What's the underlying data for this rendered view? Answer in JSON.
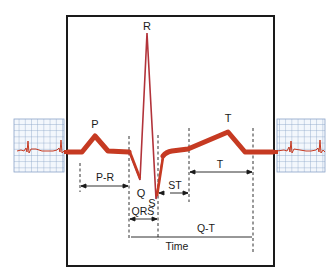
{
  "diagram": {
    "colors": {
      "trace": "#c63a22",
      "spike": "#b2333a",
      "grid": "#8aa3c8",
      "grid_bg": "#f3f7fc",
      "ink": "#1a1a1a",
      "frame": "#1a1a1a"
    },
    "wave_labels": {
      "p": "P",
      "q": "Q",
      "r": "R",
      "s": "S",
      "t": "T"
    },
    "interval_labels": {
      "pr": "P-R",
      "qrs": "QRS",
      "st": "ST",
      "t": "T",
      "qt": "Q-T",
      "time": "Time"
    },
    "side_strips": [
      {
        "position": "left",
        "description": "ECG grid strip with rhythm trace"
      },
      {
        "position": "right",
        "description": "ECG grid strip with rhythm trace"
      }
    ]
  }
}
